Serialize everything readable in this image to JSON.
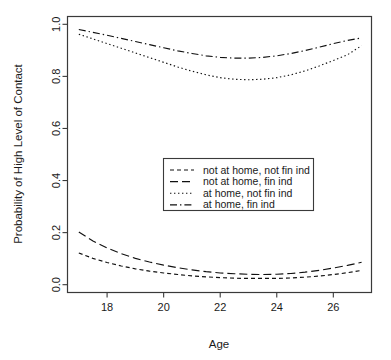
{
  "chart_data": {
    "type": "line",
    "title": "",
    "xlabel": "Age",
    "ylabel": "Probability of High Level of Contact",
    "xlim": [
      16.6,
      27.35
    ],
    "ylim": [
      -0.03,
      1.03
    ],
    "xticks": [
      18,
      20,
      22,
      24,
      26
    ],
    "xtick_labels": [
      "18",
      "20",
      "22",
      "24",
      "26"
    ],
    "yticks": [
      0.0,
      0.2,
      0.4,
      0.6,
      0.8,
      1.0
    ],
    "ytick_labels": [
      "0.0",
      "0.2",
      "0.4",
      "0.6",
      "0.8",
      "1.0"
    ],
    "grid": false,
    "legend_position": "center",
    "x": [
      17,
      17.5,
      18,
      18.5,
      19,
      19.5,
      20,
      20.5,
      21,
      21.5,
      22,
      22.5,
      23,
      23.5,
      24,
      24.5,
      25,
      25.5,
      26,
      26.5,
      27
    ],
    "series": [
      {
        "name": "not at home, not fin ind",
        "dash_style": "short-dash",
        "color": "#111111",
        "values": [
          0.122,
          0.101,
          0.085,
          0.072,
          0.061,
          0.052,
          0.045,
          0.039,
          0.034,
          0.03,
          0.027,
          0.025,
          0.024,
          0.024,
          0.024,
          0.026,
          0.029,
          0.033,
          0.039,
          0.046,
          0.055
        ]
      },
      {
        "name": "not at home, fin ind",
        "dash_style": "long-dash",
        "color": "#111111",
        "values": [
          0.202,
          0.168,
          0.141,
          0.119,
          0.101,
          0.087,
          0.075,
          0.065,
          0.057,
          0.05,
          0.045,
          0.042,
          0.04,
          0.039,
          0.04,
          0.043,
          0.048,
          0.055,
          0.064,
          0.074,
          0.086
        ]
      },
      {
        "name": "at home, not fin ind",
        "dash_style": "dotted",
        "color": "#111111",
        "values": [
          0.962,
          0.944,
          0.926,
          0.908,
          0.89,
          0.872,
          0.854,
          0.836,
          0.82,
          0.806,
          0.795,
          0.789,
          0.787,
          0.789,
          0.795,
          0.806,
          0.821,
          0.84,
          0.861,
          0.883,
          0.918
        ]
      },
      {
        "name": "at home, fin ind",
        "dash_style": "dash-dot",
        "color": "#111111",
        "values": [
          0.98,
          0.969,
          0.958,
          0.946,
          0.934,
          0.922,
          0.91,
          0.898,
          0.888,
          0.879,
          0.873,
          0.87,
          0.87,
          0.873,
          0.879,
          0.888,
          0.899,
          0.912,
          0.926,
          0.938,
          0.948
        ]
      }
    ]
  },
  "legend": {
    "entries": [
      {
        "label": "not at home, not fin ind",
        "dash_style": "short-dash"
      },
      {
        "label": "not at home, fin ind",
        "dash_style": "long-dash"
      },
      {
        "label": "at home, not fin ind",
        "dash_style": "dotted"
      },
      {
        "label": "at home, fin ind",
        "dash_style": "dash-dot"
      }
    ]
  }
}
